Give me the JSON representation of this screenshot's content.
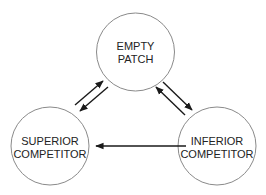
{
  "diagram": {
    "type": "state-transition",
    "nodes": [
      {
        "id": "empty",
        "line1": "EMPTY",
        "line2": "PATCH",
        "cx": 135.5,
        "cy": 52,
        "r": 39
      },
      {
        "id": "superior",
        "line1": "SUPERIOR",
        "line2": "COMPETITOR",
        "cx": 50,
        "cy": 146,
        "r": 39
      },
      {
        "id": "inferior",
        "line1": "INFERIOR",
        "line2": "COMPETITOR",
        "cx": 217,
        "cy": 146,
        "r": 39
      }
    ],
    "edges": [
      {
        "from": "superior",
        "to": "empty"
      },
      {
        "from": "empty",
        "to": "superior"
      },
      {
        "from": "empty",
        "to": "inferior"
      },
      {
        "from": "inferior",
        "to": "empty"
      },
      {
        "from": "inferior",
        "to": "superior"
      }
    ],
    "colors": {
      "circle_stroke": "#8a8a8a",
      "arrow": "#1a1a1a",
      "text": "#222222",
      "background": "#ffffff"
    }
  }
}
